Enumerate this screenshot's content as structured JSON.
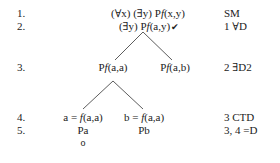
{
  "tree": {
    "rows": [
      {
        "num": "1.",
        "justification": "SM"
      },
      {
        "num": "2.",
        "justification": "1 ∀D"
      },
      {
        "num": "3.",
        "justification": "2 ∃D2"
      },
      {
        "num": "4.",
        "justification": "3 CTD"
      },
      {
        "num": "5.",
        "justification": "3, 4 =D"
      }
    ],
    "line1": {
      "prefix": "(∀x) (∃y) P",
      "f": "f",
      "args": "(x,y)"
    },
    "line2": {
      "prefix": "(∃y) P",
      "f": "f",
      "args": "(a,y)",
      "check": "✔"
    },
    "line3_left": {
      "prefix": "P",
      "f": "f",
      "args": "(a,a)"
    },
    "line3_right": {
      "prefix": "P",
      "f": "f",
      "args": "(a,b)"
    },
    "line4_left": {
      "prefix": "a = ",
      "f": "f",
      "args": "(a,a)"
    },
    "line4_right": {
      "prefix": "b = ",
      "f": "f",
      "args": "(a,a)"
    },
    "line5_left": "Pa",
    "line5_right": "Pb",
    "branch_closed_marker": "o"
  }
}
